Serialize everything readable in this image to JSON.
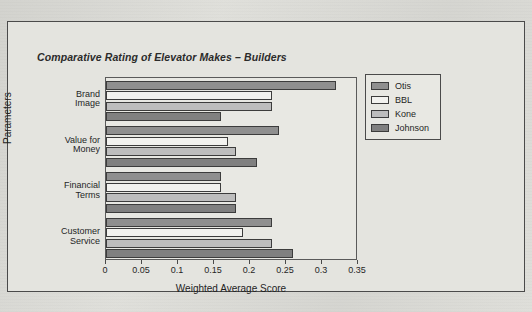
{
  "chart_data": {
    "type": "bar",
    "orientation": "horizontal",
    "title": "Comparative Rating of Elevator Makes – Builders",
    "xlabel": "Weighted Average Score",
    "ylabel": "Parameters",
    "xlim": [
      0,
      0.35
    ],
    "xticks": [
      "0",
      "0.05",
      "0.1",
      "0.15",
      "0.2",
      "0.25",
      "0.3",
      "0.35"
    ],
    "xtick_values": [
      0,
      0.05,
      0.1,
      0.15,
      0.2,
      0.25,
      0.3,
      0.35
    ],
    "grid": false,
    "legend_position": "right",
    "categories": [
      "Brand Image",
      "Value for Money",
      "Financial Terms",
      "Customer Service"
    ],
    "series": [
      {
        "name": "Otis",
        "color": "#8f8f8f",
        "values": [
          0.32,
          0.24,
          0.16,
          0.23
        ]
      },
      {
        "name": "BBL",
        "color": "#f2f2ef",
        "values": [
          0.23,
          0.17,
          0.16,
          0.19
        ]
      },
      {
        "name": "Kone",
        "color": "#bdbdbd",
        "values": [
          0.23,
          0.18,
          0.18,
          0.23
        ]
      },
      {
        "name": "Johnson",
        "color": "#808080",
        "values": [
          0.16,
          0.21,
          0.18,
          0.26
        ]
      }
    ]
  },
  "legend": {
    "items": [
      {
        "label": "Otis"
      },
      {
        "label": "BBL"
      },
      {
        "label": "Kone"
      },
      {
        "label": "Johnson"
      }
    ]
  },
  "axis": {
    "y_categories": [
      {
        "line1": "Brand",
        "line2": "Image"
      },
      {
        "line1": "Value for",
        "line2": "Money"
      },
      {
        "line1": "Financial",
        "line2": "Terms"
      },
      {
        "line1": "Customer",
        "line2": "Service"
      }
    ]
  }
}
